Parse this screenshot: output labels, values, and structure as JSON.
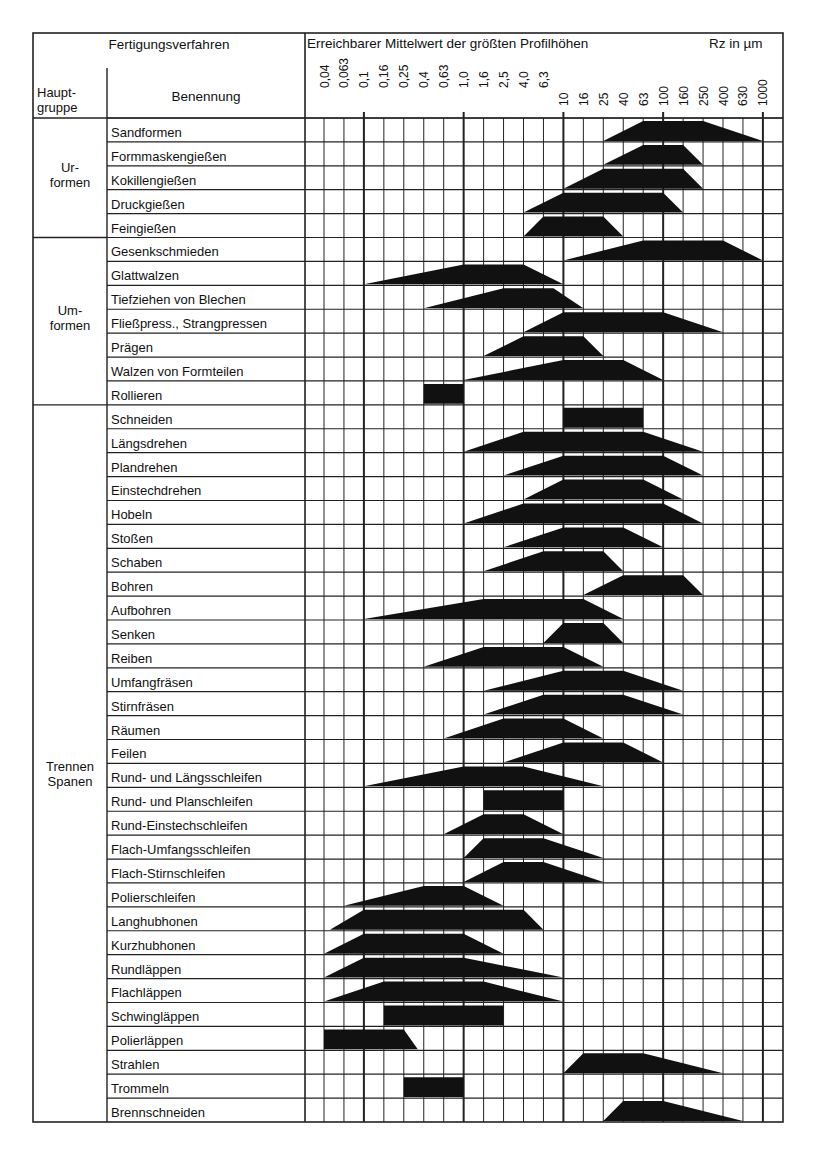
{
  "header": {
    "left_title": "Fertigungsverfahren",
    "col_group": "Haupt-\ngruppe",
    "col_name": "Benennung",
    "chart_title": "Erreichbarer Mittelwert der größten Profilhöhen",
    "unit": "Rz in µm"
  },
  "groups": [
    {
      "label": "Ur-\nformen",
      "start": 0,
      "count": 5
    },
    {
      "label": "Um-\nformen",
      "start": 5,
      "count": 7
    },
    {
      "label": "Trennen\nSpanen",
      "start": 12,
      "count": 36
    }
  ],
  "colors": {
    "bar": "#111111",
    "grid": "#222222",
    "background": "#ffffff"
  },
  "chart_data": {
    "type": "table",
    "title": "Erreichbarer Mittelwert der größten Profilhöhen",
    "xlabel": "Rz in µm",
    "x_scale": "log (Renard series)",
    "tick_labels": [
      "0,04",
      "0,063",
      "0,1",
      "0,16",
      "0,25",
      "0,4",
      "0,63",
      "1,0",
      "1,6",
      "2,5",
      "4,0",
      "6,3",
      "10",
      "16",
      "25",
      "40",
      "63",
      "100",
      "160",
      "250",
      "400",
      "630",
      "1000"
    ],
    "note": "Each bar given as [base_left, top_left, top_right, base_right] in tick-index units (0 = 0,04 ... 22 = 1000). Flat top = usual range, sloped ends = attainable range.",
    "rows": [
      {
        "group": "Urformen",
        "name": "Sandformen",
        "bar": [
          14,
          16,
          19,
          22
        ]
      },
      {
        "group": "Urformen",
        "name": "Formmaskengießen",
        "bar": [
          14,
          16,
          18,
          19
        ]
      },
      {
        "group": "Urformen",
        "name": "Kokillengießen",
        "bar": [
          12,
          14,
          18,
          19
        ]
      },
      {
        "group": "Urformen",
        "name": "Druckgießen",
        "bar": [
          10,
          12,
          17,
          18
        ]
      },
      {
        "group": "Urformen",
        "name": "Feingießen",
        "bar": [
          10,
          11,
          14,
          15
        ]
      },
      {
        "group": "Umformen",
        "name": "Gesenkschmieden",
        "bar": [
          12,
          16,
          20,
          22
        ]
      },
      {
        "group": "Umformen",
        "name": "Glattwalzen",
        "bar": [
          2,
          7,
          10,
          12
        ]
      },
      {
        "group": "Umformen",
        "name": "Tiefziehen von Blechen",
        "bar": [
          5,
          9,
          11.5,
          13
        ]
      },
      {
        "group": "Umformen",
        "name": "Fließpress., Strangpressen",
        "bar": [
          10,
          12,
          17,
          20
        ]
      },
      {
        "group": "Umformen",
        "name": "Prägen",
        "bar": [
          8,
          10,
          13,
          14
        ]
      },
      {
        "group": "Umformen",
        "name": "Walzen von Formteilen",
        "bar": [
          7,
          12,
          15,
          17
        ]
      },
      {
        "group": "Umformen",
        "name": "Rollieren",
        "bar": [
          5,
          5,
          7,
          7
        ]
      },
      {
        "group": "Trennen Spanen",
        "name": "Schneiden",
        "bar": [
          12,
          12,
          16,
          16
        ]
      },
      {
        "group": "Trennen Spanen",
        "name": "Längsdrehen",
        "bar": [
          7,
          10,
          16,
          19
        ]
      },
      {
        "group": "Trennen Spanen",
        "name": "Plandrehen",
        "bar": [
          9,
          12,
          17,
          19
        ]
      },
      {
        "group": "Trennen Spanen",
        "name": "Einstechdrehen",
        "bar": [
          10,
          12,
          16,
          18
        ]
      },
      {
        "group": "Trennen Spanen",
        "name": "Hobeln",
        "bar": [
          7,
          10,
          17,
          19
        ]
      },
      {
        "group": "Trennen Spanen",
        "name": "Stoßen",
        "bar": [
          9,
          12,
          15,
          17
        ]
      },
      {
        "group": "Trennen Spanen",
        "name": "Schaben",
        "bar": [
          8,
          11,
          14,
          15
        ]
      },
      {
        "group": "Trennen Spanen",
        "name": "Bohren",
        "bar": [
          13,
          15,
          18,
          19
        ]
      },
      {
        "group": "Trennen Spanen",
        "name": "Aufbohren",
        "bar": [
          2,
          8,
          13,
          15
        ]
      },
      {
        "group": "Trennen Spanen",
        "name": "Senken",
        "bar": [
          11,
          12,
          14,
          15
        ]
      },
      {
        "group": "Trennen Spanen",
        "name": "Reiben",
        "bar": [
          5,
          8,
          12,
          14
        ]
      },
      {
        "group": "Trennen Spanen",
        "name": "Umfangfräsen",
        "bar": [
          8,
          12,
          15,
          18
        ]
      },
      {
        "group": "Trennen Spanen",
        "name": "Stirnfräsen",
        "bar": [
          8,
          11,
          15,
          18
        ]
      },
      {
        "group": "Trennen Spanen",
        "name": "Räumen",
        "bar": [
          6,
          9,
          12,
          14
        ]
      },
      {
        "group": "Trennen Spanen",
        "name": "Feilen",
        "bar": [
          9,
          12,
          15,
          17
        ]
      },
      {
        "group": "Trennen Spanen",
        "name": "Rund- und Längsschleifen",
        "bar": [
          2,
          7,
          10,
          14
        ]
      },
      {
        "group": "Trennen Spanen",
        "name": "Rund- und Planschleifen",
        "bar": [
          8,
          8,
          12,
          12
        ]
      },
      {
        "group": "Trennen Spanen",
        "name": "Rund-Einstechschleifen",
        "bar": [
          6,
          8,
          10,
          12
        ]
      },
      {
        "group": "Trennen Spanen",
        "name": "Flach-Umfangsschleifen",
        "bar": [
          7,
          8,
          11,
          14
        ]
      },
      {
        "group": "Trennen Spanen",
        "name": "Flach-Stirnschleifen",
        "bar": [
          7,
          9,
          11,
          14
        ]
      },
      {
        "group": "Trennen Spanen",
        "name": "Polierschleifen",
        "bar": [
          1,
          5,
          7,
          9
        ]
      },
      {
        "group": "Trennen Spanen",
        "name": "Langhubhonen",
        "bar": [
          0.3,
          2,
          10,
          11
        ]
      },
      {
        "group": "Trennen Spanen",
        "name": "Kurzhubhonen",
        "bar": [
          0,
          2,
          7,
          9
        ]
      },
      {
        "group": "Trennen Spanen",
        "name": "Rundläppen",
        "bar": [
          0,
          2,
          7,
          12
        ]
      },
      {
        "group": "Trennen Spanen",
        "name": "Flachläppen",
        "bar": [
          0,
          3,
          8,
          12
        ]
      },
      {
        "group": "Trennen Spanen",
        "name": "Schwingläppen",
        "bar": [
          3,
          3,
          9,
          9
        ]
      },
      {
        "group": "Trennen Spanen",
        "name": "Polierläppen",
        "bar": [
          0,
          0,
          4,
          4.7
        ]
      },
      {
        "group": "Trennen Spanen",
        "name": "Strahlen",
        "bar": [
          12,
          13,
          16,
          20
        ]
      },
      {
        "group": "Trennen Spanen",
        "name": "Trommeln",
        "bar": [
          4,
          4,
          7,
          7
        ]
      },
      {
        "group": "Trennen Spanen",
        "name": "Brennschneiden",
        "bar": [
          14,
          15,
          17,
          21
        ]
      }
    ]
  }
}
